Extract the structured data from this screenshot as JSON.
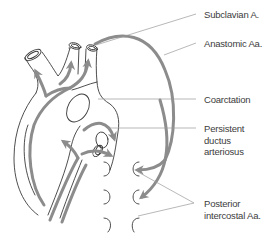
{
  "diagram": {
    "colors": {
      "outline": "#3a3a3a",
      "flow_arrow": "#8c8c8c",
      "leader": "#9a9a9a",
      "text": "#3c3c3c"
    },
    "labels": [
      {
        "id": "subclavian",
        "text": "Subclavian A.",
        "lines": [
          "Subclavian A."
        ]
      },
      {
        "id": "anastomic",
        "text": "Anastomic Aa.",
        "lines": [
          "Anastomic Aa."
        ]
      },
      {
        "id": "coarctation",
        "text": "Coarctation",
        "lines": [
          "Coarctation"
        ]
      },
      {
        "id": "ductus",
        "text": "Persistent ductus arteriosus",
        "lines": [
          "Persistent",
          "ductus",
          "arteriosus"
        ]
      },
      {
        "id": "intercostal",
        "text": "Posterior intercostal Aa.",
        "lines": [
          "Posterior",
          "intercostal Aa."
        ]
      }
    ]
  }
}
